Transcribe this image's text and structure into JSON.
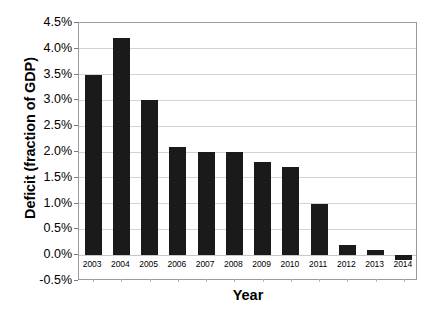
{
  "chart_data": {
    "type": "bar",
    "title": "",
    "xlabel": "Year",
    "ylabel": "Deficit (fraction of GDP)",
    "categories": [
      "2003",
      "2004",
      "2005",
      "2006",
      "2007",
      "2008",
      "2009",
      "2010",
      "2011",
      "2012",
      "2013",
      "2014"
    ],
    "values": [
      3.5,
      4.2,
      3.0,
      2.1,
      2.0,
      2.0,
      1.8,
      1.7,
      1.0,
      0.2,
      0.1,
      -0.1
    ],
    "value_labels": [
      "3.5%",
      "4.2%",
      "3.0%",
      "2.1%",
      "2.0%",
      "2.0%",
      "1.8%",
      "1.7%",
      "1.0%",
      "0.2%",
      "0.1%",
      "-0.1%"
    ],
    "ylim": [
      -0.5,
      4.5
    ],
    "yticks": [
      4.5,
      4.0,
      3.5,
      3.0,
      2.5,
      2.0,
      1.5,
      1.0,
      0.5,
      0.0,
      -0.5
    ],
    "ytick_labels": [
      "4.5%",
      "4.0%",
      "3.5%",
      "3.0%",
      "2.5%",
      "2.0%",
      "1.5%",
      "1.0%",
      "0.5%",
      "0.0%",
      "-0.5%"
    ],
    "grid": true,
    "legend": null,
    "bar_color": "#1a1a1a",
    "grid_color": "#d3d3d3",
    "frame_color": "#9a9a9a",
    "units": "percent of GDP"
  }
}
